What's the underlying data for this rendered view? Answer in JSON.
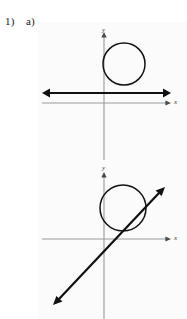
{
  "page": {
    "background_color": "#ffffff",
    "panel_color": "#fbfbfb",
    "width": 187,
    "height": 319
  },
  "labels": {
    "question_number": "1)",
    "part_letter": "a)"
  },
  "colors": {
    "axis": "#9a9a9a",
    "axis_arrow": "#4a4a4a",
    "curve": "#121212",
    "bold_line": "#111111",
    "text": "#1a1a1a"
  },
  "figures": [
    {
      "id": "upper-figure",
      "caption": "circle tangent to a horizontal line",
      "axes": {
        "x_label": "x",
        "y_label": "y",
        "x_axis_y": 103,
        "y_axis_x": 104,
        "x_axis_from": 42,
        "x_axis_to": 171,
        "y_axis_from": 33,
        "y_axis_to": 152
      },
      "circle": {
        "center_x": 124,
        "center_y": 64,
        "radius": 21,
        "style": "outline"
      },
      "line": {
        "kind": "tangent",
        "x1": 43,
        "y1": 93,
        "x2": 170,
        "y2": 93,
        "arrows": "both",
        "weight": "bold"
      }
    },
    {
      "id": "lower-figure",
      "caption": "circle crossed by a diagonal secant line",
      "axes": {
        "x_label": "x",
        "y_label": "y",
        "x_axis_y": 239,
        "y_axis_x": 104,
        "x_axis_from": 42,
        "x_axis_to": 171,
        "y_axis_from": 172,
        "y_axis_to": 319
      },
      "circle": {
        "center_x": 123,
        "center_y": 208,
        "radius": 23,
        "style": "outline"
      },
      "line": {
        "kind": "secant",
        "x1": 54,
        "y1": 304,
        "x2": 164,
        "y2": 188,
        "arrows": "both",
        "weight": "bold"
      }
    }
  ]
}
